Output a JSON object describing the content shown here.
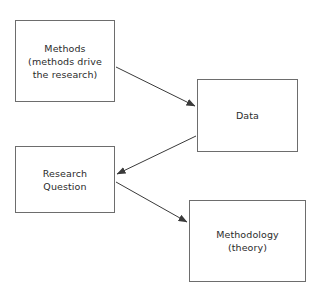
{
  "diagram": {
    "background_color": "#ffffff",
    "border_color": "#6d6d6d",
    "text_color": "#2b2b2b",
    "arrow_color": "#3a3a3a",
    "nodes": [
      {
        "id": "methods",
        "label": "Methods\n(methods drive\nthe research)",
        "x": 15,
        "y": 20,
        "width": 100,
        "height": 82
      },
      {
        "id": "data",
        "label": "Data",
        "x": 197,
        "y": 79,
        "width": 101,
        "height": 73
      },
      {
        "id": "research-question",
        "label": "Research\nQuestion",
        "x": 15,
        "y": 146,
        "width": 100,
        "height": 67
      },
      {
        "id": "methodology",
        "label": "Methodology\n(theory)",
        "x": 189,
        "y": 200,
        "width": 117,
        "height": 82
      }
    ],
    "arrows": [
      {
        "id": "methods-to-data",
        "from": "methods",
        "to": "data",
        "x1": 116,
        "y1": 67,
        "x2": 195,
        "y2": 106
      },
      {
        "id": "data-to-research-question",
        "from": "data",
        "to": "research-question",
        "x1": 196,
        "y1": 136,
        "x2": 117,
        "y2": 174
      },
      {
        "id": "research-question-to-methodology",
        "from": "research-question",
        "to": "methodology",
        "x1": 116,
        "y1": 182,
        "x2": 187,
        "y2": 222
      }
    ]
  }
}
